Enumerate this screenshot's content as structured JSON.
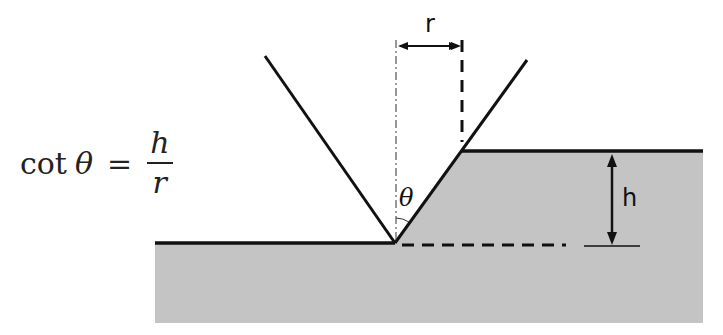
{
  "formula": {
    "lhs_function": "cot",
    "lhs_variable": "θ",
    "equals": "=",
    "numerator": "h",
    "denominator": "r"
  },
  "labels": {
    "r": "r",
    "h": "h",
    "theta": "θ"
  },
  "colors": {
    "material_fill": "#c4c4c4",
    "line": "#111111",
    "background": "#ffffff"
  }
}
